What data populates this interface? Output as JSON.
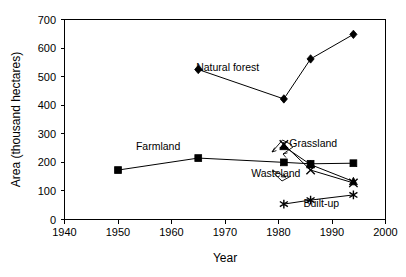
{
  "chart_data": {
    "type": "line",
    "title": "",
    "xlabel": "Year",
    "ylabel": "Area (thousand hectares)",
    "xlim": [
      1940,
      2000
    ],
    "ylim": [
      0,
      700
    ],
    "xticks": [
      1940,
      1950,
      1960,
      1970,
      1980,
      1990,
      2000
    ],
    "yticks": [
      0,
      100,
      200,
      300,
      400,
      500,
      600,
      700
    ],
    "grid": false,
    "legend_position": "inline-annotations",
    "series": [
      {
        "name": "Natural forest",
        "marker": "diamond",
        "x": [
          1965,
          1981,
          1986,
          1994
        ],
        "values": [
          525,
          422,
          562,
          648
        ]
      },
      {
        "name": "Farmland",
        "marker": "square",
        "x": [
          1950,
          1965,
          1981,
          1986,
          1994
        ],
        "values": [
          173,
          215,
          200,
          195,
          197
        ]
      },
      {
        "name": "Grassland",
        "marker": "triangle",
        "x": [
          1981,
          1986,
          1994
        ],
        "values": [
          256,
          192,
          133
        ]
      },
      {
        "name": "Wasteland",
        "marker": "x",
        "x": [
          1981,
          1986,
          1994
        ],
        "values": [
          263,
          173,
          128
        ]
      },
      {
        "name": "Built-up",
        "marker": "asterisk",
        "x": [
          1981,
          1986,
          1994
        ],
        "values": [
          54,
          68,
          86
        ]
      }
    ],
    "annotations": [
      {
        "text": "Natural forest",
        "x": 1970.5,
        "y": 520
      },
      {
        "text": "Farmland",
        "x": 1957.5,
        "y": 245
      },
      {
        "text": "Grassland",
        "x": 1986.5,
        "y": 255
      },
      {
        "text": "Wasteland",
        "x": 1979.5,
        "y": 148
      },
      {
        "text": "Built-up",
        "x": 1988.0,
        "y": 45
      }
    ]
  },
  "axes": {
    "y_title": "Area (thousand hectares)",
    "x_title": "Year",
    "y_tick_labels": [
      "700",
      "600",
      "500",
      "400",
      "300",
      "200",
      "100",
      "0"
    ],
    "x_tick_labels": [
      "1940",
      "1950",
      "1960",
      "1970",
      "1980",
      "1990",
      "2000"
    ]
  },
  "labels": {
    "natural_forest": "Natural forest",
    "farmland": "Farmland",
    "grassland": "Grassland",
    "wasteland": "Wasteland",
    "built_up": "Built-up"
  },
  "colors": {
    "line": "#000000",
    "axis": "#000000",
    "background": "#ffffff"
  }
}
